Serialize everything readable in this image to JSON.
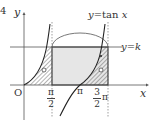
{
  "problem_number": "4",
  "axes": {
    "x_label": "x",
    "y_label": "y",
    "origin_label": "O"
  },
  "curve_label": "y = tan x",
  "curve_label_parts": {
    "lhs": "y",
    "eq": "=",
    "fn": "tan",
    "var": "x"
  },
  "line_label": "y = k",
  "line_label_parts": {
    "lhs": "y",
    "eq": "=",
    "rhs": "k"
  },
  "x_ticks": [
    {
      "label": "π/2",
      "num": "π",
      "den": "2"
    },
    {
      "label": "π",
      "num": "π"
    },
    {
      "label": "3π/2",
      "coef": "3",
      "den": "2",
      "sym": "π"
    }
  ],
  "colors": {
    "axis": "#555555",
    "curve": "#222222",
    "rect_fill": "#e6e6e6",
    "hatch": "#444444",
    "dotted": "#777777"
  },
  "markers": [
    "open-circle-left",
    "open-circle-right"
  ]
}
